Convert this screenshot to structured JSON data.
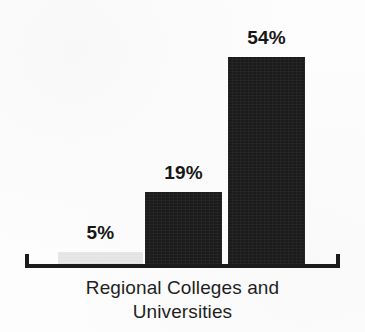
{
  "chart_data": {
    "type": "bar",
    "title": "",
    "subtitle": "",
    "xlabel": "Regional Colleges and Universities",
    "ylabel": "",
    "categories": [
      "",
      "",
      ""
    ],
    "values": [
      5,
      19,
      54
    ],
    "value_labels": [
      "5%",
      "19%",
      "54%"
    ],
    "bar_colors": [
      "#e7e7e7",
      "#1b1b1b",
      "#1b1b1b"
    ],
    "ylim": [
      0,
      60
    ],
    "grid": false,
    "legend": "none",
    "axis": {
      "baseline_visible": true,
      "end_ticks": true,
      "tick_labels": []
    }
  },
  "caption": {
    "line1": "Regional Colleges and",
    "line2": "Universities"
  },
  "colors": {
    "background": "#fdfdfd",
    "ink": "#1b1b1b",
    "bar_dark": "#1b1b1b",
    "bar_light": "#e7e7e7",
    "label_text": "#171717"
  }
}
